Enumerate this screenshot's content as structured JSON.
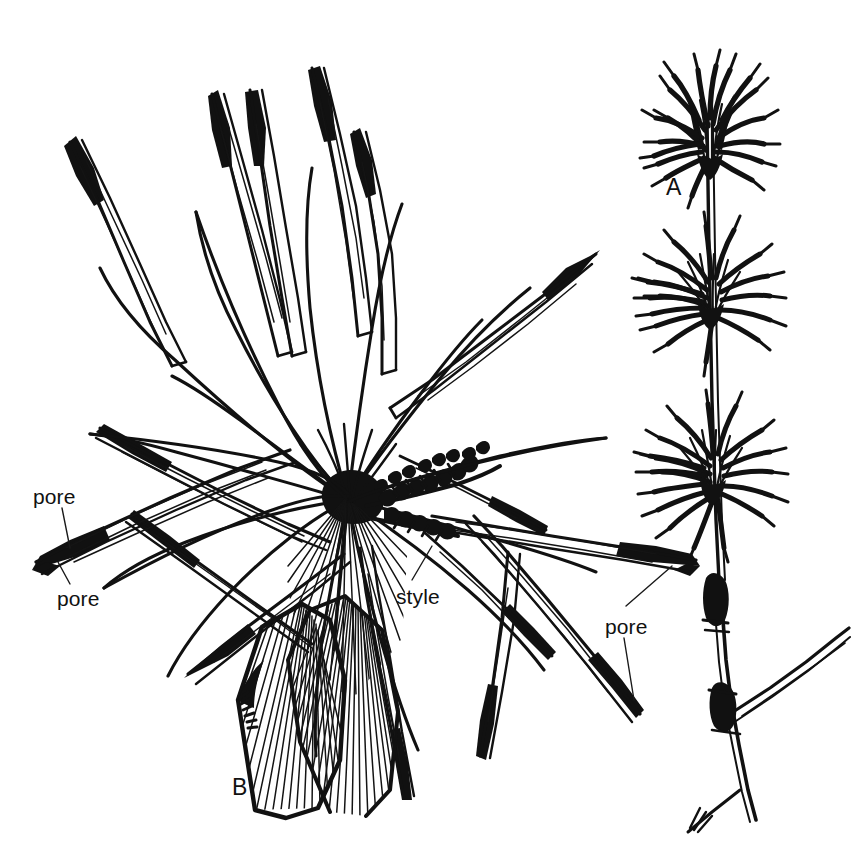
{
  "figure": {
    "kind": "botanical-line-drawing",
    "medium": "pen-and-ink",
    "background_color": "#ffffff",
    "ink_color": "#111111",
    "width_px": 854,
    "height_px": 849
  },
  "panels": [
    {
      "id": "A",
      "label": "A",
      "label_x": 666,
      "label_y": 176,
      "description": "erect stem bearing three whorled clusters of narrow spreading leaves, with a jointed lower stem and one lateral branch",
      "whorl_count": 3
    },
    {
      "id": "B",
      "label": "B",
      "label_x": 232,
      "label_y": 776,
      "description": "enlarged dissected floret showing radiating stamens with long anthers, filaments, feathery style and two large striped glumes",
      "anther_count": 16
    }
  ],
  "callouts": [
    {
      "id": "pore-upper-left",
      "text": "pore",
      "x": 33,
      "y": 486,
      "leader": "from label up-right to dark anther apex"
    },
    {
      "id": "pore-lower-left",
      "text": "pore",
      "x": 57,
      "y": 588,
      "leader": "from label up to dark anther apex"
    },
    {
      "id": "style",
      "text": "style",
      "x": 396,
      "y": 586,
      "leader": "from label up-right to feathery style branch"
    },
    {
      "id": "pore-right",
      "text": "pore",
      "x": 605,
      "y": 616,
      "leader": "two leaders, up-left to anther apex and down-right to anther apex"
    }
  ],
  "caption": {
    "visible": false,
    "text": ""
  }
}
